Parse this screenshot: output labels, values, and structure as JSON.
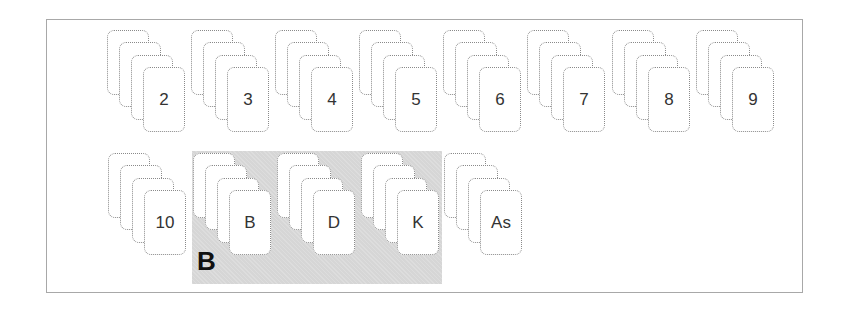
{
  "diagram": {
    "highlight_group": {
      "label": "B",
      "members": [
        "B",
        "D",
        "K"
      ],
      "fill_color": "#d6d6d6"
    },
    "rows": [
      {
        "stacks": [
          {
            "rank": "2"
          },
          {
            "rank": "3"
          },
          {
            "rank": "4"
          },
          {
            "rank": "5"
          },
          {
            "rank": "6"
          },
          {
            "rank": "7"
          },
          {
            "rank": "8"
          },
          {
            "rank": "9"
          }
        ]
      },
      {
        "stacks": [
          {
            "rank": "10"
          },
          {
            "rank": "B"
          },
          {
            "rank": "D"
          },
          {
            "rank": "K"
          },
          {
            "rank": "As"
          }
        ]
      }
    ],
    "cards_per_stack": 4,
    "card_border_color": "#8a8a8a",
    "frame_border_color": "#a8a8a8"
  }
}
